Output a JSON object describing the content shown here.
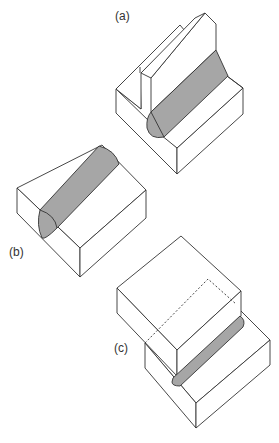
{
  "figure": {
    "panels": [
      {
        "id": "a",
        "label": "(a)",
        "type": "T-joint fillet weld between two upright plates on a base block"
      },
      {
        "id": "b",
        "label": "(b)",
        "type": "Surface bead weld on a rectangular block"
      },
      {
        "id": "c",
        "label": "(c)",
        "type": "Lap joint fillet weld between two offset stacked plates"
      }
    ]
  },
  "colors": {
    "line": "#333333",
    "weld_fill": "#a6a6a6",
    "background": "#ffffff"
  }
}
